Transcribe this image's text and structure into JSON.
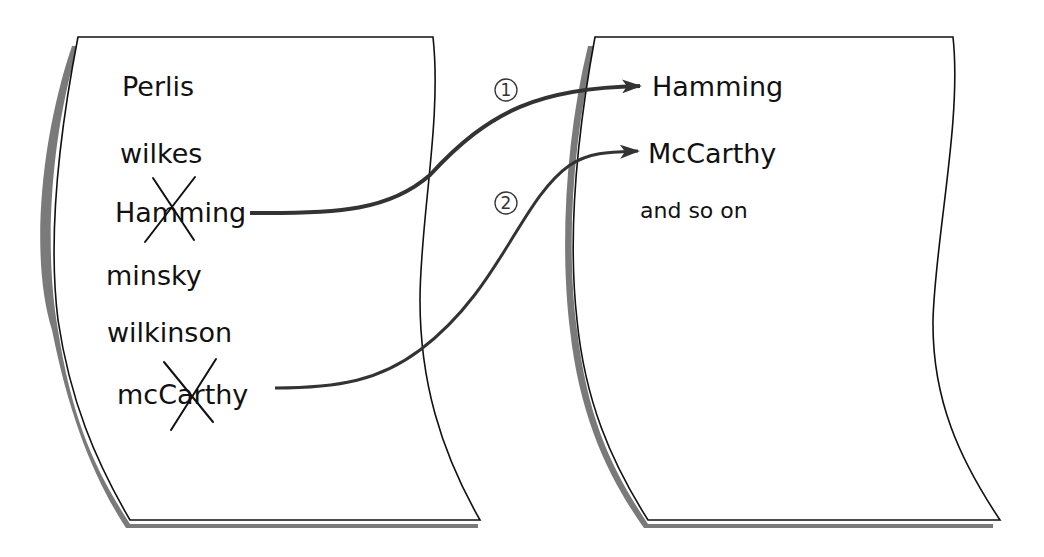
{
  "diagram": {
    "type": "list-move-illustration",
    "colors": {
      "paper": "#ffffff",
      "outline": "#111111",
      "shadow": "#7a7a7a",
      "arrow": "#333333",
      "strike": "#111111"
    },
    "source_page": {
      "items": [
        {
          "text": "Perlis",
          "struck": false
        },
        {
          "text": "wilkes",
          "struck": false
        },
        {
          "text": "Hamming",
          "struck": true
        },
        {
          "text": "minsky",
          "struck": false
        },
        {
          "text": "wilkinson",
          "struck": false
        },
        {
          "text": "mcCarthy",
          "struck": true
        }
      ]
    },
    "target_page": {
      "items": [
        {
          "text": "Hamming"
        },
        {
          "text": "McCarthy"
        },
        {
          "text": "and so on"
        }
      ]
    },
    "arrows": [
      {
        "label": "①",
        "from": "Hamming",
        "to": "Hamming"
      },
      {
        "label": "②",
        "from": "mcCarthy",
        "to": "McCarthy"
      }
    ]
  }
}
